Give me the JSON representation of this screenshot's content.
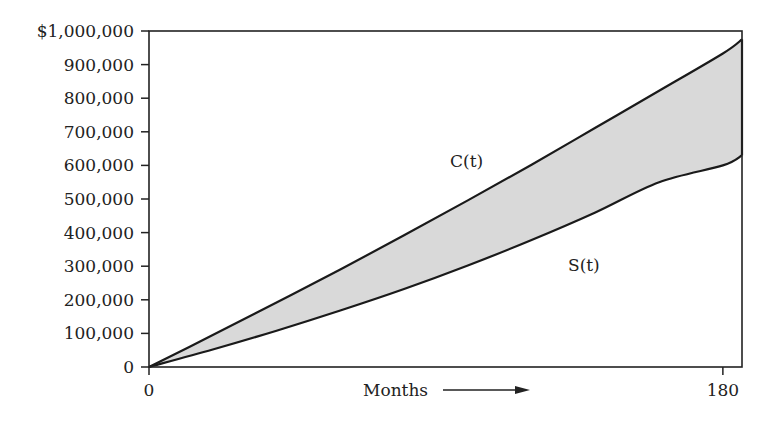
{
  "chart_data": {
    "type": "area",
    "title": "",
    "xlabel": "Months",
    "ylabel": "",
    "xlim": [
      0,
      186
    ],
    "ylim": [
      0,
      1000000
    ],
    "grid": false,
    "x_ticks": [
      {
        "value": 0,
        "label": "0"
      },
      {
        "value": 180,
        "label": "180"
      }
    ],
    "y_ticks": [
      {
        "value": 0,
        "label": "0"
      },
      {
        "value": 100000,
        "label": "100,000"
      },
      {
        "value": 200000,
        "label": "200,000"
      },
      {
        "value": 300000,
        "label": "300,000"
      },
      {
        "value": 400000,
        "label": "400,000"
      },
      {
        "value": 500000,
        "label": "500,000"
      },
      {
        "value": 600000,
        "label": "600,000"
      },
      {
        "value": 700000,
        "label": "700,000"
      },
      {
        "value": 800000,
        "label": "800,000"
      },
      {
        "value": 900000,
        "label": "900,000"
      },
      {
        "value": 1000000,
        "label": "$1,000,000"
      }
    ],
    "x": [
      0,
      20,
      40,
      60,
      80,
      100,
      120,
      140,
      160,
      180,
      186
    ],
    "series": [
      {
        "name": "C(t)",
        "values": [
          0,
          95000,
          192000,
          290000,
          392000,
          496000,
          602000,
          712000,
          822000,
          933000,
          975000
        ]
      },
      {
        "name": "S(t)",
        "values": [
          0,
          52000,
          108000,
          168000,
          232000,
          302000,
          378000,
          460000,
          550000,
          600000,
          630000
        ]
      }
    ],
    "shaded_region": {
      "between": [
        "C(t)",
        "S(t)"
      ],
      "color": "#d9d9d9"
    },
    "annotations": [
      {
        "text": "C(t)",
        "x": 110,
        "y": 600000
      },
      {
        "text": "S(t)",
        "x": 140,
        "y": 300000
      },
      {
        "text": "Months →",
        "position": "below x-axis"
      }
    ]
  },
  "labels": {
    "x_axis": "Months",
    "curve_c": "C(t)",
    "curve_s": "S(t)"
  }
}
